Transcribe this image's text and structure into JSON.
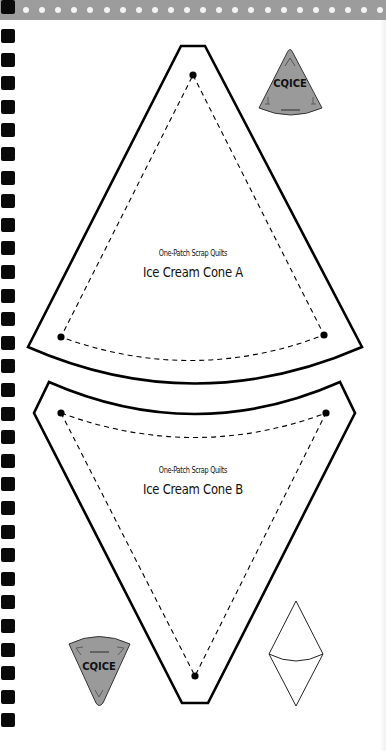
{
  "page": {
    "background": "#ffffff",
    "header_band_color": "#9c9c9c",
    "binding_hole_color": "#0a0a0a",
    "binding_holes_count": 31,
    "header_dots_count": 23
  },
  "template_a": {
    "subtitle": "One-Patch Scrap Quilts",
    "title": "Ice Cream Cone A",
    "shape": "cutting-template-cone-point-up"
  },
  "template_b": {
    "subtitle": "One-Patch Scrap Quilts",
    "title": "Ice Cream Cone B",
    "shape": "cutting-template-cone-point-down"
  },
  "badge_top": {
    "text": "CQICE",
    "fill": "#9a9a9a"
  },
  "badge_bottom": {
    "text": "CQICE",
    "fill": "#9a9a9a"
  },
  "assembly_diagram": {
    "description": "diamond-of-two-cones"
  }
}
